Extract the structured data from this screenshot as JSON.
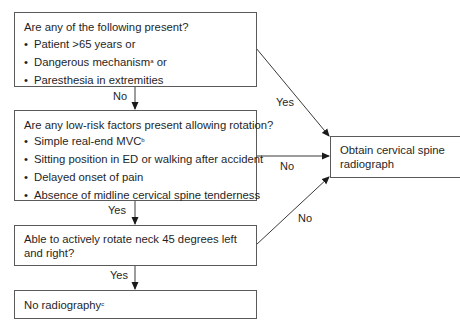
{
  "boxes": {
    "q1": {
      "title": "Are any of the following present?",
      "items": [
        {
          "text": "Patient >65 years or",
          "sup": ""
        },
        {
          "text": "Dangerous mechanism",
          "sup": "a",
          "after": " or"
        },
        {
          "text": "Paresthesia in extremities",
          "sup": ""
        }
      ]
    },
    "q2": {
      "title": "Are any low-risk factors present allowing rotation?",
      "items": [
        {
          "text": "Simple real-end MVC",
          "sup": "b"
        },
        {
          "text": "Sitting position in ED or walking after accident",
          "sup": ""
        },
        {
          "text": "Delayed onset of pain",
          "sup": ""
        },
        {
          "text": "Absence of midline cervical spine tenderness",
          "sup": ""
        }
      ]
    },
    "q3": {
      "line1": "Able to actively rotate neck 45 degrees left",
      "line2": "and right?"
    },
    "no_radiography": {
      "text": "No radiography",
      "sup": "c"
    },
    "obtain": {
      "line1": "Obtain cervical spine",
      "line2": "radiograph"
    }
  },
  "edge_labels": {
    "q1_no": "No",
    "q1_yes": "Yes",
    "q2_no": "No",
    "q2_yes": "Yes",
    "q3_no": "No",
    "q3_yes": "Yes"
  },
  "bullet_glyph": "•",
  "colors": {
    "border": "#5a5a5a",
    "text": "#1f1f1f",
    "line": "#3a3a3a"
  }
}
